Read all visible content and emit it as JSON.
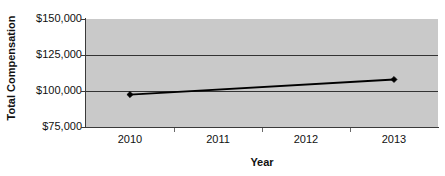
{
  "chart_data": {
    "type": "line",
    "title": "",
    "xlabel": "Year",
    "ylabel": "Total Compensation",
    "categories": [
      "2010",
      "2011",
      "2012",
      "2013"
    ],
    "series": [
      {
        "name": "Total Compensation",
        "points": [
          {
            "x": "2010",
            "y": 97500
          },
          {
            "x": "2013",
            "y": 108000
          }
        ],
        "values": [
          97500,
          null,
          null,
          108000
        ],
        "color": "#000000",
        "marker": "diamond"
      }
    ],
    "ylim": [
      75000,
      150000
    ],
    "y_ticks": [
      75000,
      100000,
      125000,
      150000
    ],
    "y_tick_labels": [
      "$75,000",
      "$100,000",
      "$125,000",
      "$150,000"
    ],
    "x_tick_labels": [
      "2010",
      "2011",
      "2012",
      "2013"
    ],
    "grid": true,
    "gridlines_at": [
      100000,
      125000
    ],
    "legend": null,
    "legend_position": "none",
    "plot_background": "#c9c9c9",
    "figure_background": "#ffffff",
    "axis_color": "#333333"
  },
  "axes": {
    "y_title": "Total Compensation",
    "x_title": "Year"
  }
}
